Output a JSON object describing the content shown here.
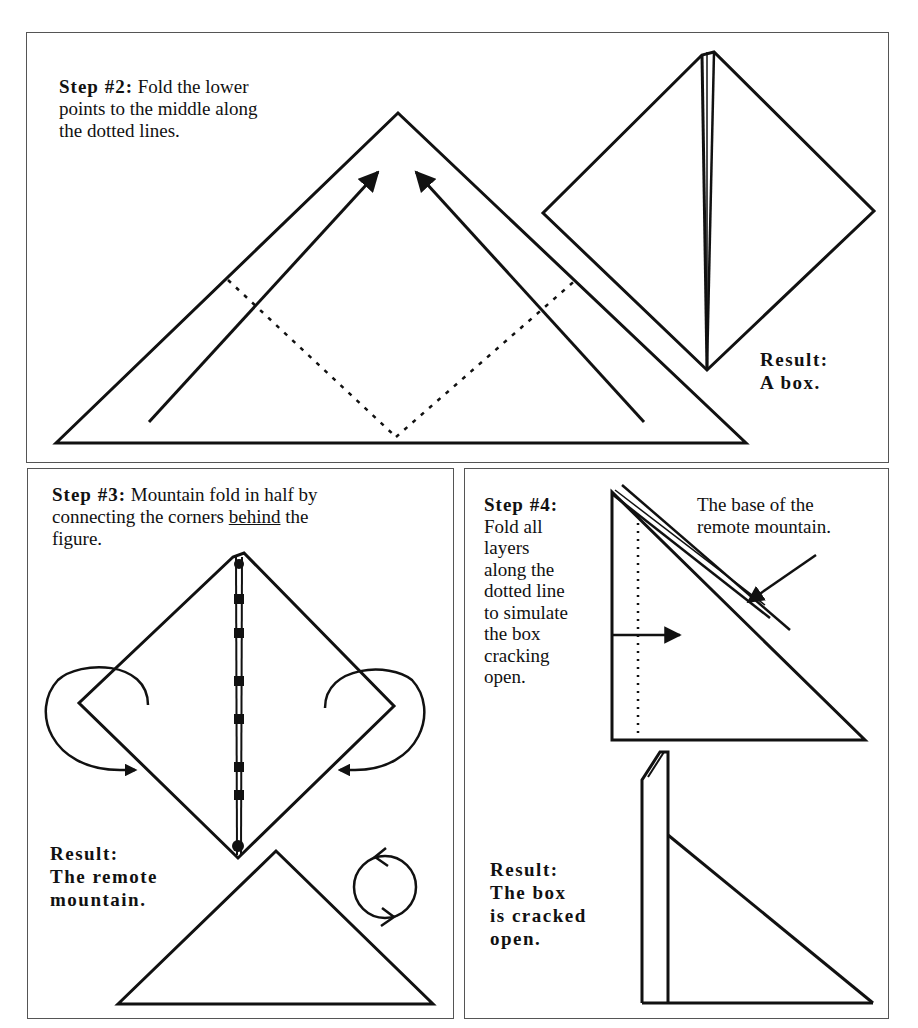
{
  "steps": [
    {
      "id": "step2",
      "label": "Step #2:",
      "instruction": "Fold the lower points to the middle along the dotted lines.",
      "instruction_lines": [
        "Fold the lower",
        "points to the middle along",
        "the dotted lines."
      ],
      "result_label": "Result:",
      "result_text": "A box."
    },
    {
      "id": "step3",
      "label": "Step #3:",
      "instruction_lines": [
        "Mountain fold in half by",
        "connecting the corners ",
        "behind",
        " the",
        "figure."
      ],
      "instruction": "Mountain fold in half by connecting the corners behind the figure.",
      "emphasis": "behind",
      "result_label": "Result:",
      "result_lines": [
        "The remote",
        "mountain."
      ]
    },
    {
      "id": "step4",
      "label": "Step #4:",
      "instruction_lines": [
        "Fold all",
        "layers",
        "along the",
        "dotted line",
        "to simulate",
        "the box",
        "cracking",
        "open."
      ],
      "instruction": "Fold all layers along the dotted line to simulate the box cracking open.",
      "annotation_lines": [
        "The base of the",
        "remote mountain."
      ],
      "result_label": "Result:",
      "result_lines": [
        "The box",
        "is cracked",
        "open."
      ]
    }
  ],
  "icons": {
    "fold_arrow": "arrow-icon",
    "mountain_fold_arrow": "curved-arrow-icon",
    "turn_over": "turn-over-icon"
  },
  "colors": {
    "line": "#111111",
    "border": "#555555",
    "background": "#ffffff"
  }
}
